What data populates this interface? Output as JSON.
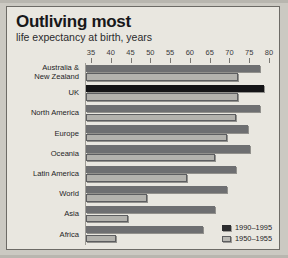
{
  "header": {
    "title": "Outliving most",
    "subtitle": "life expectancy at birth, years"
  },
  "legend": [
    {
      "label": "1990–1995",
      "key": "recent",
      "color": "#2c2d2f"
    },
    {
      "label": "1950–1955",
      "key": "old",
      "color": "#b9b8b3"
    }
  ],
  "chart_data": {
    "type": "bar",
    "orientation": "horizontal",
    "title": "Outliving most",
    "subtitle": "life expectancy at birth, years",
    "xlabel": "life expectancy at birth, years",
    "ylabel": "",
    "xlim": [
      33.5,
      81
    ],
    "xticks": [
      35,
      40,
      45,
      50,
      55,
      60,
      65,
      70,
      75,
      80
    ],
    "grid": false,
    "legend_position": "bottom-right",
    "categories": [
      "Australia &\nNew Zealand",
      "UK",
      "North America",
      "Europe",
      "Oceania",
      "Latin America",
      "World",
      "Asia",
      "Africa"
    ],
    "highlight_category": "UK",
    "series": [
      {
        "name": "1990–1995",
        "color": "#6e6f71",
        "values": [
          77.5,
          78.5,
          77.5,
          74.5,
          75.0,
          71.5,
          69.0,
          66.0,
          63.0
        ]
      },
      {
        "name": "1950–1955",
        "color": "#b3b2ad",
        "values": [
          72.0,
          72.0,
          71.5,
          69.0,
          66.0,
          59.0,
          49.0,
          44.0,
          41.0
        ]
      }
    ]
  }
}
